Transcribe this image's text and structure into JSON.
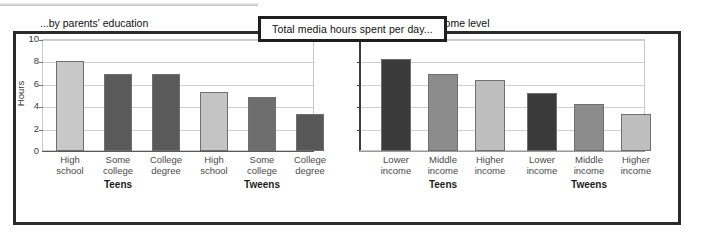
{
  "figure": {
    "title": "Total media hours spent per day..."
  },
  "chart_data": [
    {
      "type": "bar",
      "title": "...by parents' education",
      "xlabel": "",
      "ylabel": "Hours",
      "ylim": [
        0,
        10
      ],
      "yticks": [
        0,
        2,
        4,
        6,
        8,
        10
      ],
      "grid": true,
      "legend": "none",
      "groups": [
        "Teens",
        "Tweens"
      ],
      "categories": [
        "High school",
        "Some college",
        "College degree",
        "High school",
        "Some college",
        "College degree"
      ],
      "values": [
        8.0,
        6.9,
        6.85,
        5.3,
        4.85,
        3.3
      ],
      "bar_colors": [
        "#c8c8c8",
        "#5a5a5a",
        "#5a5a5a",
        "#c4c4c4",
        "#6e6e6e",
        "#585858"
      ],
      "bars": [
        {
          "group": "Teens",
          "category_line1": "High",
          "category_line2": "school",
          "value": 8.0,
          "color": "#c8c8c8"
        },
        {
          "group": "Teens",
          "category_line1": "Some",
          "category_line2": "college",
          "value": 6.9,
          "color": "#5a5a5a"
        },
        {
          "group": "Teens",
          "category_line1": "College",
          "category_line2": "degree",
          "value": 6.85,
          "color": "#5a5a5a"
        },
        {
          "group": "Tweens",
          "category_line1": "High",
          "category_line2": "school",
          "value": 5.3,
          "color": "#c4c4c4"
        },
        {
          "group": "Tweens",
          "category_line1": "Some",
          "category_line2": "college",
          "value": 4.85,
          "color": "#6e6e6e"
        },
        {
          "group": "Tweens",
          "category_line1": "College",
          "category_line2": "degree",
          "value": 3.3,
          "color": "#585858"
        }
      ]
    },
    {
      "type": "bar",
      "title": "...by household income level",
      "xlabel": "",
      "ylabel": "",
      "ylim": [
        0,
        10
      ],
      "yticks": [
        0,
        2,
        4,
        6,
        8,
        10
      ],
      "ytick_labels_shown": false,
      "grid": true,
      "legend": "none",
      "groups": [
        "Teens",
        "Tweens"
      ],
      "categories": [
        "Lower income",
        "Middle income",
        "Higher income",
        "Lower income",
        "Middle income",
        "Higher income"
      ],
      "values": [
        8.2,
        6.9,
        6.3,
        5.2,
        4.2,
        3.3
      ],
      "bar_colors": [
        "#3a3a3a",
        "#8c8c8c",
        "#bebebe",
        "#3a3a3a",
        "#8c8c8c",
        "#bebebe"
      ],
      "bars": [
        {
          "group": "Teens",
          "category_line1": "Lower",
          "category_line2": "income",
          "value": 8.2,
          "color": "#3a3a3a"
        },
        {
          "group": "Teens",
          "category_line1": "Middle",
          "category_line2": "income",
          "value": 6.9,
          "color": "#8c8c8c"
        },
        {
          "group": "Teens",
          "category_line1": "Higher",
          "category_line2": "income",
          "value": 6.3,
          "color": "#bebebe"
        },
        {
          "group": "Tweens",
          "category_line1": "Lower",
          "category_line2": "income",
          "value": 5.2,
          "color": "#3a3a3a"
        },
        {
          "group": "Tweens",
          "category_line1": "Middle",
          "category_line2": "income",
          "value": 4.2,
          "color": "#8c8c8c"
        },
        {
          "group": "Tweens",
          "category_line1": "Higher",
          "category_line2": "income",
          "value": 3.3,
          "color": "#bebebe"
        }
      ]
    }
  ]
}
